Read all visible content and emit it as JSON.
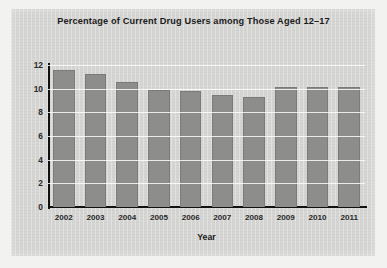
{
  "chart_data": {
    "type": "bar",
    "title": "Percentage of Current Drug Users among Those Aged 12–17",
    "xlabel": "Year",
    "ylabel": "",
    "categories": [
      "2002",
      "2003",
      "2004",
      "2005",
      "2006",
      "2007",
      "2008",
      "2009",
      "2010",
      "2011"
    ],
    "values": [
      11.6,
      11.2,
      10.6,
      9.9,
      9.8,
      9.5,
      9.3,
      10.1,
      10.1,
      10.1
    ],
    "ylim": [
      0,
      12
    ],
    "yticks": [
      "0",
      "2",
      "4",
      "6",
      "8",
      "10",
      "12"
    ],
    "ytick_values": [
      0,
      2,
      4,
      6,
      8,
      10,
      12
    ],
    "grid": "horizontal-white-over-bars",
    "legend": "none",
    "bar_color": "#8d8d8b",
    "panel_color": "#d5d5d3",
    "axis_color": "#111111",
    "text_color": "#1b1b1b"
  }
}
